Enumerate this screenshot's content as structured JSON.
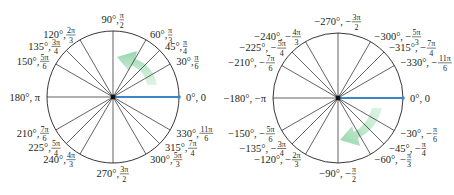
{
  "diagrams": [
    {
      "id": "positive",
      "center": [
        113,
        97
      ],
      "radius": 66,
      "highlight_color": "#3d85c6",
      "arrow_color": "#8fd4a6",
      "arrow_direction": "counterclockwise",
      "labels": [
        {
          "deg": 0,
          "text": "0°, 0",
          "num": "",
          "den": ""
        },
        {
          "deg": 30,
          "text": "30°, ",
          "num": "π",
          "den": "6"
        },
        {
          "deg": 45,
          "text": "45°, ",
          "num": "π",
          "den": "4"
        },
        {
          "deg": 60,
          "text": "60°, ",
          "num": "π",
          "den": "3"
        },
        {
          "deg": 90,
          "text": "90°, ",
          "num": "π",
          "den": "2"
        },
        {
          "deg": 120,
          "text": "120°, ",
          "num": "2π",
          "den": "3"
        },
        {
          "deg": 135,
          "text": "135°, ",
          "num": "3π",
          "den": "4"
        },
        {
          "deg": 150,
          "text": "150°, ",
          "num": "5π",
          "den": "6"
        },
        {
          "deg": 180,
          "text": "180°, π",
          "num": "",
          "den": ""
        },
        {
          "deg": 210,
          "text": "210°, ",
          "num": "7π",
          "den": "6"
        },
        {
          "deg": 225,
          "text": "225°, ",
          "num": "5π",
          "den": "4"
        },
        {
          "deg": 240,
          "text": "240°, ",
          "num": "4π",
          "den": "3"
        },
        {
          "deg": 270,
          "text": "270°, ",
          "num": "3π",
          "den": "2"
        },
        {
          "deg": 300,
          "text": "300°, ",
          "num": "5π",
          "den": "3"
        },
        {
          "deg": 315,
          "text": "315°, ",
          "num": "7π",
          "den": "4"
        },
        {
          "deg": 330,
          "text": "330°, ",
          "num": "11π",
          "den": "6"
        }
      ]
    },
    {
      "id": "negative",
      "center": [
        338,
        98
      ],
      "radius": 65,
      "highlight_color": "#3d85c6",
      "arrow_color": "#8fd4a6",
      "arrow_direction": "clockwise",
      "labels": [
        {
          "deg": 0,
          "text": "0°, 0",
          "num": "",
          "den": ""
        },
        {
          "deg": 30,
          "text": "−330°, −",
          "num": "11π",
          "den": "6"
        },
        {
          "deg": 45,
          "text": "−315°, −",
          "num": "7π",
          "den": "4"
        },
        {
          "deg": 60,
          "text": "−300°, −",
          "num": "5π",
          "den": "3"
        },
        {
          "deg": 90,
          "text": "−270°, −",
          "num": "3π",
          "den": "2"
        },
        {
          "deg": 120,
          "text": "−240°, −",
          "num": "4π",
          "den": "3"
        },
        {
          "deg": 135,
          "text": "−225°, −",
          "num": "5π",
          "den": "4"
        },
        {
          "deg": 150,
          "text": "−210°, −",
          "num": "7π",
          "den": "6"
        },
        {
          "deg": 180,
          "text": "−180°, −π",
          "num": "",
          "den": ""
        },
        {
          "deg": 210,
          "text": "−150°, −",
          "num": "5π",
          "den": "6"
        },
        {
          "deg": 225,
          "text": "−135°, −",
          "num": "3π",
          "den": "4"
        },
        {
          "deg": 240,
          "text": "−120°, −",
          "num": "2π",
          "den": "3"
        },
        {
          "deg": 270,
          "text": "−90°, −",
          "num": "π",
          "den": "2"
        },
        {
          "deg": 300,
          "text": "−60°, −",
          "num": "π",
          "den": "3"
        },
        {
          "deg": 315,
          "text": "−45°, −",
          "num": "π",
          "den": "4"
        },
        {
          "deg": 330,
          "text": "−30°, −",
          "num": "π",
          "den": "6"
        }
      ]
    }
  ]
}
